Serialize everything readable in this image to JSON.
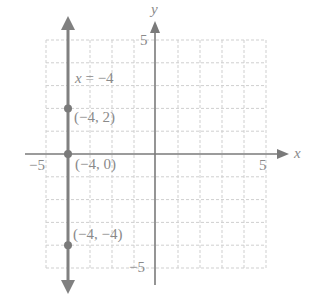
{
  "chart_data": {
    "type": "line",
    "title": "",
    "xlabel": "x",
    "ylabel": "y",
    "xlim": [
      -5,
      5
    ],
    "ylim": [
      -5,
      5
    ],
    "grid": true,
    "x_ticks_labeled": [
      -5,
      5
    ],
    "y_ticks_labeled": [
      5,
      -5
    ],
    "tick_labels": {
      "x_min": "−5",
      "x_max": "5",
      "y_max": "5",
      "y_min": "−5"
    },
    "series": [
      {
        "name": "x = −4",
        "type": "vertical-line",
        "x": -4,
        "equation_label": "x = −4"
      }
    ],
    "points": [
      {
        "x": -4,
        "y": 2,
        "label": "(−4, 2)"
      },
      {
        "x": -4,
        "y": 0,
        "label": "(−4, 0)"
      },
      {
        "x": -4,
        "y": -4,
        "label": "(−4, −4)"
      }
    ],
    "colors": {
      "line": "#808080",
      "axis": "#7a7a7a",
      "grid": "#c8c8c8",
      "text": "#8a8a8a"
    }
  },
  "labels": {
    "x_axis": "x",
    "y_axis": "y",
    "x_min": "−5",
    "x_max": "5",
    "y_max": "5",
    "y_min": "−5",
    "equation_lhs": "x",
    "equation_rhs": " = −4",
    "point_1": "(−4, 2)",
    "point_2": "(−4, 0)",
    "point_3": "(−4, −4)"
  }
}
